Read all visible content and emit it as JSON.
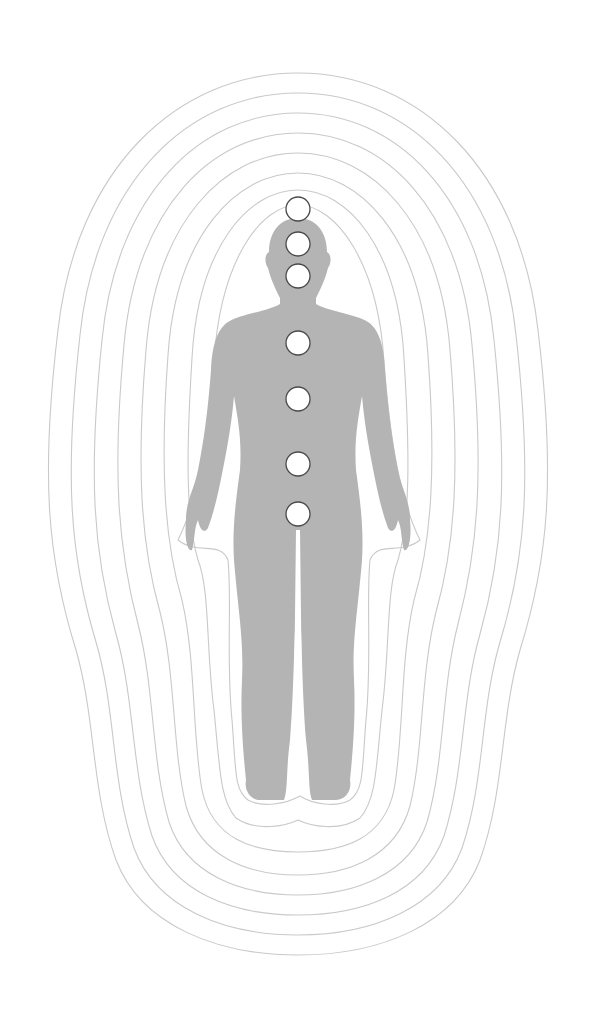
{
  "illustration": {
    "subject": "human silhouette with aura layers and chakra points",
    "colors": {
      "background": "#ffffff",
      "body": "#b4b4b4",
      "aura_line": "#c9c9c9",
      "chakra_fill": "#ffffff",
      "chakra_stroke": "#4a4a4a"
    },
    "aura_layer_count": 9,
    "chakras": [
      {
        "name": "crown",
        "cx": 298,
        "cy": 209,
        "r": 12
      },
      {
        "name": "third-eye",
        "cx": 298,
        "cy": 244,
        "r": 12
      },
      {
        "name": "throat",
        "cx": 298,
        "cy": 276,
        "r": 12
      },
      {
        "name": "heart",
        "cx": 298,
        "cy": 343,
        "r": 12
      },
      {
        "name": "solar-plexus",
        "cx": 298,
        "cy": 399,
        "r": 12
      },
      {
        "name": "sacral",
        "cx": 298,
        "cy": 464,
        "r": 12
      },
      {
        "name": "root",
        "cx": 298,
        "cy": 514,
        "r": 12
      }
    ]
  }
}
